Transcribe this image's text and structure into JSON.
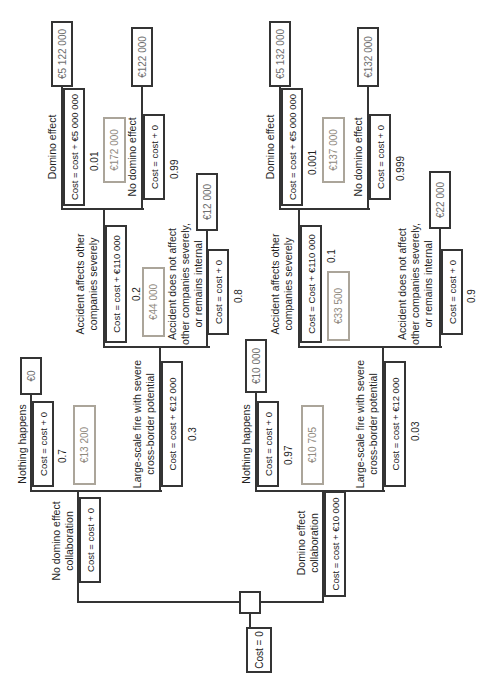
{
  "root": {
    "label": "Cost = 0"
  },
  "colors": {
    "line": "#343434",
    "box_border": "#343434",
    "ev_border": "#aba59a",
    "ev_text": "#8f897e",
    "terminal_text": "#6d6d6d"
  },
  "branches": {
    "trunk_a": {
      "name_l1": "No domino effect",
      "name_l2": "collaboration",
      "cost": "Cost = cost + 0"
    },
    "trunk_b": {
      "name_l1": "Domino effect",
      "name_l2": "collaboration",
      "cost": "Cost = cost + €10 000"
    },
    "a1": {
      "name": "Nothing happens",
      "cost": "Cost = cost + 0",
      "prob": "0.7",
      "terminal": "€0"
    },
    "a2": {
      "name_l1": "Large-scale fire with severe",
      "name_l2": "cross-border potential",
      "cost": "Cost = cost + €12 000",
      "prob": "0.3"
    },
    "b1": {
      "name_l1": "Accident affects other",
      "name_l2": "companies severely",
      "cost": "Cost = cost + €110 000",
      "prob": "0.2"
    },
    "b2": {
      "name_l1": "Accident does not affect",
      "name_l2": "other companies severely,",
      "name_l3": "or remains internal",
      "cost": "Cost = cost + 0",
      "prob": "0.8",
      "terminal": "€12 000"
    },
    "c1": {
      "name": "Domino effect",
      "cost": "Cost = cost + €5 000 000",
      "prob": "0.01",
      "terminal": "€5 122 000"
    },
    "c2": {
      "name": "No domino effect",
      "cost": "Cost = cost + 0",
      "prob": "0.99",
      "terminal": "€122 000"
    },
    "d1": {
      "name": "Nothing happens",
      "cost": "Cost = cost + 0",
      "prob": "0.97",
      "terminal": "€10 000"
    },
    "d2": {
      "name_l1": "Large-scale fire with severe",
      "name_l2": "cross-border potential",
      "cost": "Cost = cost + €12 000",
      "prob": "0.03"
    },
    "e1": {
      "name_l1": "Accident affects other",
      "name_l2": "companies severely",
      "cost": "Cost = Cost + €110 000",
      "prob": "0.1"
    },
    "e2": {
      "name_l1": "Accident does not affect",
      "name_l2": "other companies severely,",
      "name_l3": "or remains internal",
      "cost": "Cost = cost + 0",
      "prob": "0.9",
      "terminal": "€22 000"
    },
    "f1": {
      "name": "Domino effect",
      "cost": "Cost = cost + €5 000 000",
      "prob": "0.001",
      "terminal": "€5 132 000"
    },
    "f2": {
      "name": "No domino effect",
      "cost": "Cost = cost + 0",
      "prob": "0.999",
      "terminal": "€132 000"
    }
  },
  "expected_values": {
    "a": "€13 200",
    "b": "€44 000",
    "c": "€172 000",
    "d": "€10 705",
    "e": "€33 500",
    "f": "€137 000"
  }
}
